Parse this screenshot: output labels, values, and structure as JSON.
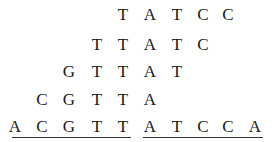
{
  "columns_x": [
    15,
    42,
    69,
    97,
    123,
    150,
    177,
    203,
    228,
    255
  ],
  "rows": [
    {
      "y": 5,
      "start_col": 4,
      "letters": [
        "T",
        "A",
        "T",
        "C",
        "C"
      ]
    },
    {
      "y": 35,
      "start_col": 3,
      "letters": [
        "T",
        "T",
        "A",
        "T",
        "C"
      ]
    },
    {
      "y": 62,
      "start_col": 2,
      "letters": [
        "G",
        "T",
        "T",
        "A",
        "T"
      ]
    },
    {
      "y": 90,
      "start_col": 1,
      "letters": [
        "C",
        "G",
        "T",
        "T",
        "A"
      ]
    },
    {
      "y": 117,
      "start_col": 0,
      "letters": [
        "A",
        "C",
        "G",
        "T",
        "T",
        "A",
        "T",
        "C",
        "C",
        "A"
      ]
    }
  ],
  "underlines": [
    {
      "x1": 12,
      "x2": 131,
      "y": 137
    },
    {
      "x1": 143,
      "x2": 263,
      "y": 137
    }
  ],
  "colors": {
    "text": "#1a1a1a",
    "line": "#333333"
  }
}
